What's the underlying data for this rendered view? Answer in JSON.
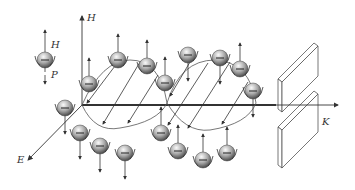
{
  "diagram": {
    "axes": {
      "h_label": "H",
      "e_label": "E",
      "k_label": "K"
    },
    "legend": {
      "h_label": "H",
      "p_label": "P",
      "particle_symbol": "−"
    },
    "colors": {
      "line": "#333333",
      "particle_light": "#f4f4f4",
      "particle_dark": "#555555",
      "background": "#ffffff"
    },
    "particles_top": [
      {
        "x": 118,
        "y": 60,
        "arrow": "up"
      },
      {
        "x": 147,
        "y": 66,
        "arrow": "up"
      },
      {
        "x": 89,
        "y": 84,
        "arrow": "up"
      },
      {
        "x": 165,
        "y": 83,
        "arrow": "up"
      },
      {
        "x": 188,
        "y": 55,
        "arrow": "down"
      },
      {
        "x": 220,
        "y": 58,
        "arrow": "down"
      },
      {
        "x": 240,
        "y": 69,
        "arrow": "up"
      },
      {
        "x": 253,
        "y": 91,
        "arrow": "down"
      }
    ],
    "particles_bottom": [
      {
        "x": 65,
        "y": 108,
        "arrow": "down"
      },
      {
        "x": 80,
        "y": 133,
        "arrow": "down"
      },
      {
        "x": 100,
        "y": 146,
        "arrow": "down"
      },
      {
        "x": 125,
        "y": 153,
        "arrow": "down"
      },
      {
        "x": 161,
        "y": 133,
        "arrow": "up"
      },
      {
        "x": 178,
        "y": 151,
        "arrow": "up"
      },
      {
        "x": 203,
        "y": 160,
        "arrow": "up"
      },
      {
        "x": 227,
        "y": 153,
        "arrow": "up"
      }
    ]
  }
}
